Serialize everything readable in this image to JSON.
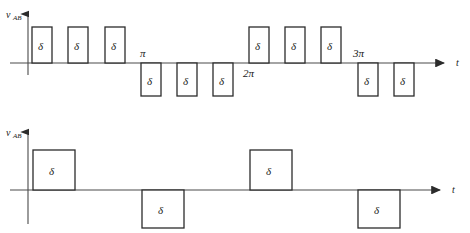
{
  "figure": {
    "background": "#ffffff",
    "line_color": "#2b2b2b",
    "axis_color": "#4a4a4a",
    "width": 470,
    "height": 233
  },
  "plots": [
    {
      "id": "top-waveform",
      "y_axis_label": "v",
      "y_axis_subscript": "AB",
      "x_axis_label": "t",
      "baseline_y": 63,
      "origin_x": 28,
      "y_axis_top": 12,
      "y_axis_bottom": 75,
      "x_axis_end": 448,
      "pulse_amplitude_up": 36,
      "pulse_amplitude_down": 33,
      "pulse_label": "δ",
      "tick_labels": [
        {
          "text": "π",
          "x": 140,
          "y": 57,
          "position": "above-axis"
        },
        {
          "text": "2π",
          "x": 247,
          "y": 76,
          "position": "below-axis"
        },
        {
          "text": "3π",
          "x": 356,
          "y": 57,
          "position": "above-axis"
        }
      ],
      "pulses": [
        {
          "index": 1,
          "x": 32,
          "width": 20,
          "polarity": "positive",
          "label": "δ"
        },
        {
          "index": 2,
          "x": 68,
          "width": 20,
          "polarity": "positive",
          "label": "δ"
        },
        {
          "index": 3,
          "x": 105,
          "width": 20,
          "polarity": "positive",
          "label": "δ"
        },
        {
          "index": 4,
          "x": 141,
          "width": 20,
          "polarity": "negative",
          "label": "δ"
        },
        {
          "index": 5,
          "x": 177,
          "width": 20,
          "polarity": "negative",
          "label": "δ"
        },
        {
          "index": 6,
          "x": 213,
          "width": 20,
          "polarity": "negative",
          "label": "δ"
        },
        {
          "index": 7,
          "x": 249,
          "width": 20,
          "polarity": "positive",
          "label": "δ"
        },
        {
          "index": 8,
          "x": 285,
          "width": 20,
          "polarity": "positive",
          "label": "δ"
        },
        {
          "index": 9,
          "x": 321,
          "width": 20,
          "polarity": "positive",
          "label": "δ"
        },
        {
          "index": 10,
          "x": 358,
          "width": 20,
          "polarity": "negative",
          "label": "δ"
        },
        {
          "index": 11,
          "x": 394,
          "width": 20,
          "polarity": "negative",
          "label": "δ"
        }
      ]
    },
    {
      "id": "bottom-waveform",
      "y_axis_label": "v",
      "y_axis_subscript": "AB",
      "x_axis_label": "t",
      "baseline_y": 190,
      "origin_x": 28,
      "y_axis_top": 130,
      "y_axis_bottom": 224,
      "x_axis_end": 448,
      "pulse_amplitude_up": 40,
      "pulse_amplitude_down": 38,
      "pulse_label": "δ",
      "tick_labels": [],
      "pulses": [
        {
          "index": 1,
          "x": 33,
          "width": 42,
          "polarity": "positive",
          "label": "δ"
        },
        {
          "index": 2,
          "x": 142,
          "width": 42,
          "polarity": "negative",
          "label": "δ"
        },
        {
          "index": 3,
          "x": 250,
          "width": 42,
          "polarity": "positive",
          "label": "δ"
        },
        {
          "index": 4,
          "x": 358,
          "width": 42,
          "polarity": "negative",
          "label": "δ"
        }
      ]
    }
  ]
}
